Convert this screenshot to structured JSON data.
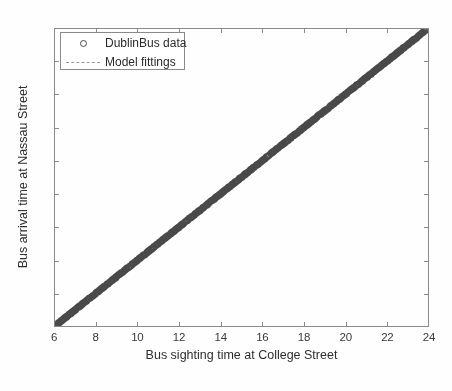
{
  "figure": {
    "width": 452,
    "height": 391,
    "background_color": "#fefefe",
    "axes_color": "#8a8a8a",
    "text_color": "#2e2e2e"
  },
  "chart_data": {
    "type": "scatter",
    "title": "",
    "xlabel": "Bus sighting time at College Street",
    "ylabel": "Bus arrival time at Nassau Street",
    "xlim": [
      6,
      24
    ],
    "ylim": [
      6,
      24
    ],
    "xticks": [
      6,
      8,
      10,
      12,
      14,
      16,
      18,
      20,
      22,
      24
    ],
    "yticks": [
      6,
      8,
      10,
      12,
      14,
      16,
      18,
      20,
      22,
      24
    ],
    "xticklabels": [
      "6",
      "8",
      "10",
      "12",
      "14",
      "16",
      "18",
      "20",
      "22",
      "24"
    ],
    "yticklabels": [
      "6",
      "8",
      "10",
      "12",
      "14",
      "16",
      "18",
      "20",
      "22",
      "24"
    ],
    "grid": false,
    "box": true,
    "tick_direction": "in",
    "legend_position": "upper left",
    "series": [
      {
        "name": "DublinBus data",
        "type": "scatter",
        "marker": "circle",
        "marker_size": 6,
        "marker_color": "#4a4a4a",
        "marker_filled": false,
        "description": "Dense overlapping circular markers lying along the identity line y = x, spanning x from about 6.1 to 23.9",
        "x_range": [
          6.1,
          23.9
        ],
        "y_range": [
          6.1,
          23.95
        ],
        "n_points": 900
      },
      {
        "name": "Model fittings",
        "type": "line",
        "linestyle": "dashed",
        "color": "#8f8f8f",
        "linewidth": 1,
        "description": "Fitted model line essentially coincident with y = x",
        "x": [
          6.1,
          23.9
        ],
        "y": [
          6.12,
          23.93
        ],
        "slope": 1.0,
        "intercept": 0.02
      }
    ]
  },
  "legend": {
    "entries": [
      {
        "label": "DublinBus data",
        "marker": "circle-marker"
      },
      {
        "label": "Model fittings",
        "marker": "dashed-line-marker"
      }
    ]
  }
}
